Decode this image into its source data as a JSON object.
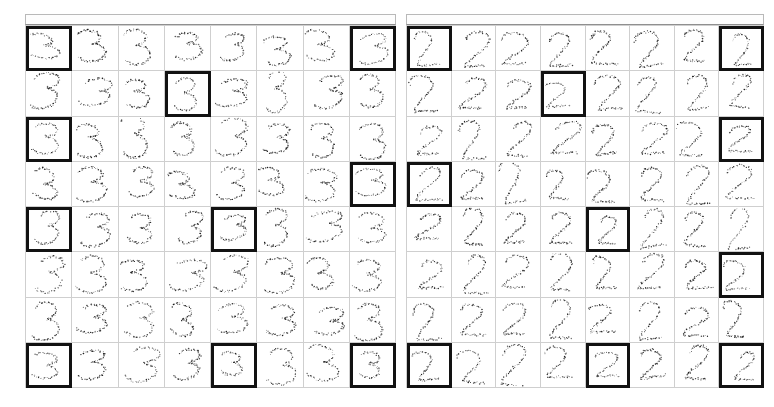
{
  "figure": {
    "background_color": "#ffffff",
    "width": 774,
    "height": 407,
    "panel_count": 2,
    "grid_line_color": "#cfcfcf",
    "highlight_border_color": "#121212",
    "point_color": "#1a1a1a"
  },
  "panels": [
    {
      "id": "left-panel",
      "position": "left",
      "header_label": "",
      "digit": "3",
      "rows": 8,
      "columns": 8,
      "cell_count": 64,
      "highlighted_cells": [
        {
          "row": 1,
          "col": 1
        },
        {
          "row": 1,
          "col": 8
        },
        {
          "row": 2,
          "col": 4
        },
        {
          "row": 3,
          "col": 1
        },
        {
          "row": 4,
          "col": 8
        },
        {
          "row": 5,
          "col": 1
        },
        {
          "row": 5,
          "col": 5
        },
        {
          "row": 8,
          "col": 1
        },
        {
          "row": 8,
          "col": 5
        },
        {
          "row": 8,
          "col": 8
        }
      ],
      "highlight_count": 10,
      "cell_tag_label": ""
    },
    {
      "id": "right-panel",
      "position": "right",
      "header_label": "",
      "digit": "2",
      "rows": 8,
      "columns": 8,
      "cell_count": 64,
      "highlighted_cells": [
        {
          "row": 1,
          "col": 1
        },
        {
          "row": 1,
          "col": 8
        },
        {
          "row": 2,
          "col": 4
        },
        {
          "row": 3,
          "col": 8
        },
        {
          "row": 4,
          "col": 1
        },
        {
          "row": 5,
          "col": 5
        },
        {
          "row": 6,
          "col": 8
        },
        {
          "row": 8,
          "col": 1
        },
        {
          "row": 8,
          "col": 5
        },
        {
          "row": 8,
          "col": 8
        }
      ],
      "highlight_count": 10,
      "cell_tag_label": ""
    }
  ],
  "chart_data": {
    "type": "scatter",
    "title": "",
    "subtitle": "",
    "xlabel": "",
    "ylabel": "",
    "grid": true,
    "legend": "none",
    "panels": [
      {
        "name": "digit-3-grid",
        "digit": "3",
        "layout": [
          8,
          8
        ],
        "points_per_cell": 70,
        "xlim": [
          0,
          1
        ],
        "ylim": [
          0,
          1
        ],
        "marker": "dot",
        "marker_size": 1.2,
        "color": "#1a1a1a"
      },
      {
        "name": "digit-2-grid",
        "digit": "2",
        "layout": [
          8,
          8
        ],
        "points_per_cell": 70,
        "xlim": [
          0,
          1
        ],
        "ylim": [
          0,
          1
        ],
        "marker": "dot",
        "marker_size": 1.2,
        "color": "#1a1a1a"
      }
    ]
  }
}
